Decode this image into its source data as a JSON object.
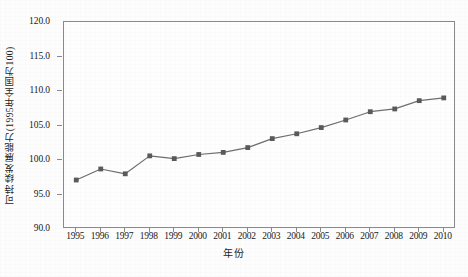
{
  "chart_data": {
    "type": "line",
    "title": "",
    "subtitle": "",
    "xlabel": "年份",
    "ylabel": "可持续发展能力(1995年全国为100)",
    "categories": [
      "1995",
      "1996",
      "1997",
      "1998",
      "1999",
      "2000",
      "2001",
      "2002",
      "2003",
      "2004",
      "2005",
      "2006",
      "2007",
      "2008",
      "2009",
      "2010"
    ],
    "x": [
      1995,
      1996,
      1997,
      1998,
      1999,
      2000,
      2001,
      2002,
      2003,
      2004,
      2005,
      2006,
      2007,
      2008,
      2009,
      2010
    ],
    "values": [
      97.1,
      98.7,
      98.0,
      100.6,
      100.2,
      100.8,
      101.1,
      101.8,
      103.1,
      103.8,
      104.7,
      105.8,
      107.0,
      107.4,
      108.6,
      109.0
    ],
    "series": [
      {
        "name": "可持续发展能力",
        "values": [
          97.1,
          98.7,
          98.0,
          100.6,
          100.2,
          100.8,
          101.1,
          101.8,
          103.1,
          103.8,
          104.7,
          105.8,
          107.0,
          107.4,
          108.6,
          109.0
        ]
      }
    ],
    "ylim": [
      90.0,
      120.0
    ],
    "xlim": [
      1995,
      2010
    ],
    "ytick_labels": [
      "120.0",
      "115.0",
      "110.0",
      "105.0",
      "100.0",
      "95.0",
      "90.0"
    ],
    "ytick_values": [
      120.0,
      115.0,
      110.0,
      105.0,
      100.0,
      95.0,
      90.0
    ],
    "xtick_labels": [
      "1995",
      "1996",
      "1997",
      "1998",
      "1999",
      "2000",
      "2001",
      "2002",
      "2003",
      "2004",
      "2005",
      "2006",
      "2007",
      "2008",
      "2009",
      "2010"
    ],
    "grid": false,
    "legend": "none",
    "legend_position": "none",
    "marker": "square",
    "line_color": "#6e6e6e",
    "marker_color": "#5a5a5a",
    "axis_color": "#8a8a8a",
    "plot_background": "#fefefe",
    "annotations": []
  }
}
